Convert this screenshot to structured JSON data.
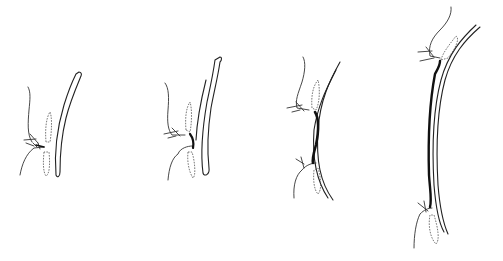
{
  "figure": {
    "type": "line-art anatomical sequence",
    "background": "#ffffff",
    "ink_color": "#222222",
    "panel_count": 4,
    "panels": [
      {
        "index": 1,
        "stage": "initial",
        "connector": "short"
      },
      {
        "index": 2,
        "stage": "early elongation",
        "connector": "short-thick"
      },
      {
        "index": 3,
        "stage": "mid elongation",
        "connector": "medium-thick"
      },
      {
        "index": 4,
        "stage": "full elongation",
        "connector": "long-thick"
      }
    ]
  }
}
